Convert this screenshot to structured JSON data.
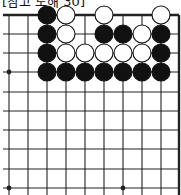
{
  "caption": "[참고 도해 30]",
  "board": {
    "colors": {
      "black": "#111111",
      "white": "#ffffff",
      "line": "#222222",
      "background": "#ffffff"
    },
    "columns_x": [
      9,
      28,
      47,
      66,
      85,
      104,
      123,
      142,
      161,
      179
    ],
    "rows_y": [
      15,
      34,
      53,
      72,
      92,
      111,
      130,
      149,
      169,
      188
    ],
    "edges": {
      "top": true,
      "right": true,
      "left": false,
      "bottom": false
    },
    "star_points": [
      {
        "col": 0,
        "row": 3
      },
      {
        "col": 0,
        "row": 9
      },
      {
        "col": 6,
        "row": 9
      }
    ],
    "stones": [
      {
        "col": 2,
        "row": 0,
        "color": "black"
      },
      {
        "col": 3,
        "row": 0,
        "color": "white"
      },
      {
        "col": 5,
        "row": 0,
        "color": "white"
      },
      {
        "col": 8,
        "row": 0,
        "color": "white"
      },
      {
        "col": 2,
        "row": 1,
        "color": "black"
      },
      {
        "col": 3,
        "row": 1,
        "color": "white"
      },
      {
        "col": 5,
        "row": 1,
        "color": "black"
      },
      {
        "col": 6,
        "row": 1,
        "color": "black"
      },
      {
        "col": 7,
        "row": 1,
        "color": "white"
      },
      {
        "col": 8,
        "row": 1,
        "color": "black"
      },
      {
        "col": 2,
        "row": 2,
        "color": "black"
      },
      {
        "col": 3,
        "row": 2,
        "color": "white"
      },
      {
        "col": 4,
        "row": 2,
        "color": "white"
      },
      {
        "col": 5,
        "row": 2,
        "color": "white"
      },
      {
        "col": 6,
        "row": 2,
        "color": "white"
      },
      {
        "col": 7,
        "row": 2,
        "color": "white"
      },
      {
        "col": 8,
        "row": 2,
        "color": "black"
      },
      {
        "col": 2,
        "row": 3,
        "color": "black"
      },
      {
        "col": 3,
        "row": 3,
        "color": "black"
      },
      {
        "col": 4,
        "row": 3,
        "color": "black"
      },
      {
        "col": 5,
        "row": 3,
        "color": "black"
      },
      {
        "col": 6,
        "row": 3,
        "color": "black"
      },
      {
        "col": 7,
        "row": 3,
        "color": "black"
      },
      {
        "col": 8,
        "row": 3,
        "color": "black"
      }
    ]
  }
}
